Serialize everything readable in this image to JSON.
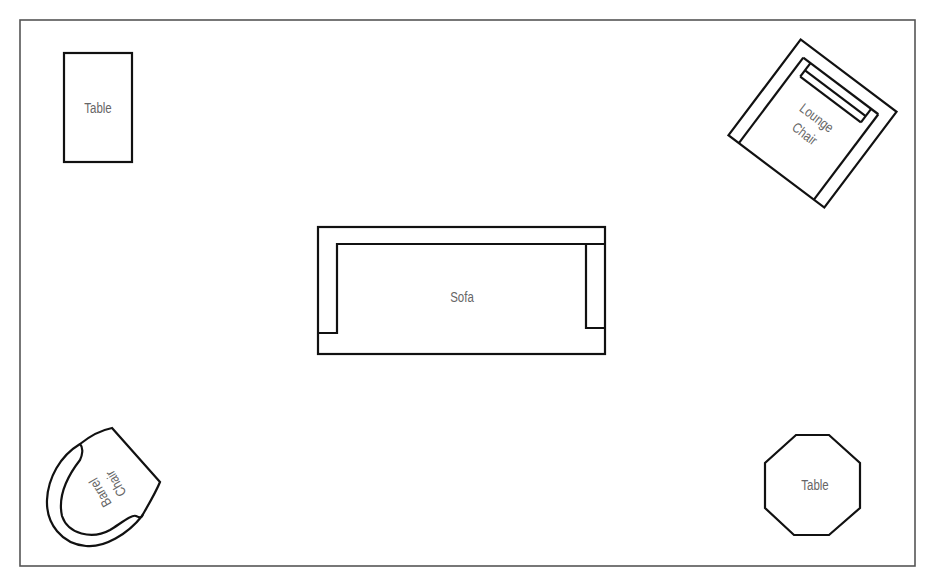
{
  "diagram": {
    "type": "floor-plan",
    "room": {
      "border_color": "#555555"
    },
    "items": [
      {
        "id": "table-rect",
        "label": "Table",
        "shape": "rectangle"
      },
      {
        "id": "lounge-chair",
        "label_line1": "Lounge",
        "label_line2": "Chair",
        "shape": "rotated-square-armchair"
      },
      {
        "id": "sofa",
        "label": "Sofa",
        "shape": "sofa"
      },
      {
        "id": "barrel-chair",
        "label_line1": "Barrel",
        "label_line2": "Chair",
        "shape": "barrel"
      },
      {
        "id": "table-octagon",
        "label": "Table",
        "shape": "octagon"
      }
    ],
    "colors": {
      "stroke": "#111111",
      "label": "#666666",
      "background": "#ffffff"
    }
  }
}
